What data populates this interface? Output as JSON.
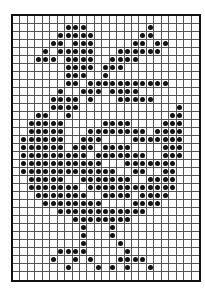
{
  "chart": {
    "cols": 25,
    "rows": 33,
    "dot_color": "#111111",
    "grid_color": "#555555",
    "background": "#ffffff",
    "filled": {
      "0": [],
      "1": [
        7,
        8,
        9,
        18
      ],
      "2": [
        6,
        7,
        8,
        9,
        10,
        17,
        18
      ],
      "3": [
        5,
        6,
        8,
        9,
        10,
        16,
        17,
        19,
        20
      ],
      "4": [
        4,
        6,
        7,
        8,
        9,
        10,
        14,
        15,
        16,
        17,
        18,
        19
      ],
      "5": [
        3,
        4,
        5,
        7,
        8,
        9,
        10,
        13,
        14,
        15,
        16
      ],
      "6": [
        7,
        8,
        9,
        10,
        12,
        13,
        14
      ],
      "7": [
        7,
        8,
        9,
        12
      ],
      "8": [
        7,
        8,
        10,
        11,
        12,
        13,
        14,
        15,
        16,
        17,
        18,
        19,
        20
      ],
      "9": [
        6,
        9,
        10,
        11,
        13,
        14,
        15,
        16
      ],
      "10": [
        5,
        6,
        7,
        8,
        10,
        14,
        15,
        16,
        17,
        18
      ],
      "11": [
        5,
        6,
        7,
        8,
        22
      ],
      "12": [
        3,
        4,
        7,
        21,
        22
      ],
      "13": [
        2,
        3,
        4,
        5,
        6,
        12,
        13,
        14,
        15,
        20,
        21,
        22
      ],
      "14": [
        2,
        3,
        4,
        5,
        6,
        10,
        11,
        12,
        13,
        14,
        15,
        16,
        17,
        19,
        20,
        21,
        22
      ],
      "15": [
        1,
        2,
        3,
        4,
        5,
        6,
        9,
        10,
        11,
        16,
        17,
        18,
        19,
        20,
        21,
        22
      ],
      "16": [
        1,
        2,
        3,
        4,
        5,
        6,
        8,
        9,
        10,
        12,
        13,
        14,
        15,
        20,
        21,
        22
      ],
      "17": [
        1,
        2,
        3,
        4,
        5,
        6,
        7,
        8,
        9,
        11,
        12,
        13,
        14,
        15,
        16,
        17,
        20,
        21,
        22
      ],
      "18": [
        1,
        2,
        3,
        4,
        5,
        6,
        7,
        8,
        9,
        10,
        11,
        15,
        16,
        17,
        18,
        19,
        20,
        21
      ],
      "19": [
        1,
        2,
        3,
        4,
        5,
        6,
        7,
        8,
        9,
        10,
        11,
        12,
        13,
        16,
        17,
        20,
        21
      ],
      "20": [
        2,
        3,
        4,
        5,
        6,
        9,
        10,
        11,
        12,
        13,
        14,
        15,
        18,
        19,
        20,
        21
      ],
      "21": [
        2,
        3,
        4,
        5,
        6,
        7,
        8,
        10,
        11,
        12,
        13,
        14,
        15,
        16,
        17,
        18,
        19,
        20,
        21
      ],
      "22": [
        3,
        4,
        5,
        6,
        7,
        8,
        9,
        12,
        13,
        14,
        15,
        17,
        18,
        19,
        20
      ],
      "23": [
        4,
        5,
        6,
        7,
        8,
        9,
        10,
        11,
        16,
        17,
        18,
        19
      ],
      "24": [
        6,
        7,
        8,
        9,
        10,
        11,
        12,
        13,
        14,
        15,
        16,
        17
      ],
      "25": [
        8,
        9,
        10,
        11,
        12,
        13,
        14,
        15
      ],
      "26": [
        9,
        13
      ],
      "27": [
        9,
        13
      ],
      "28": [
        9,
        14
      ],
      "29": [
        6,
        7,
        8,
        9,
        15
      ],
      "30": [
        5,
        8,
        10,
        14,
        15,
        16,
        17
      ],
      "31": [
        7,
        11,
        13,
        15,
        18
      ],
      "32": []
    }
  }
}
